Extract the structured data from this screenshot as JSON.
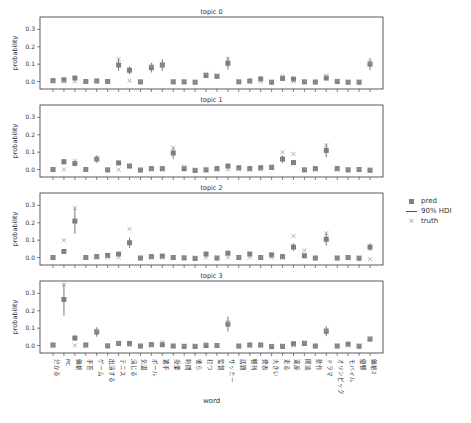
{
  "chart_data": [
    {
      "type": "scatter",
      "title": "topic 0",
      "xlabel": "word",
      "ylabel": "probability",
      "ylim": [
        -0.02,
        0.36
      ],
      "yticks": [
        "0.0",
        "0.1",
        "0.2",
        "0.3"
      ],
      "categories": [
        "分かる",
        "PC",
        "価格",
        "手首",
        "ゲーム",
        "出演する",
        "テニス",
        "演じる",
        "気温",
        "ボール",
        "選手",
        "授業",
        "時間",
        "彼ら",
        "打つ",
        "監督",
        "サッカー",
        "話題",
        "勝利",
        "発表",
        "大きい",
        "走る",
        "違反",
        "関連",
        "動作",
        "ドラマ",
        "オリンピック",
        "モバイル",
        "優勝",
        "価格2"
      ],
      "series": [
        {
          "name": "pred",
          "values": [
            0.005,
            0.01,
            0.02,
            0.0,
            0.003,
            0.0,
            0.095,
            0.065,
            -0.002,
            0.08,
            0.095,
            -0.002,
            -0.002,
            -0.004,
            0.035,
            0.03,
            0.105,
            -0.002,
            0.003,
            0.015,
            -0.004,
            0.018,
            0.014,
            -0.002,
            -0.003,
            0.02,
            0.0,
            -0.004,
            -0.004,
            0.1
          ]
        },
        {
          "name": "truth",
          "values": [
            0.0,
            0.0,
            0.0,
            0.0,
            0.0,
            0.0,
            0.13,
            0.005,
            0.0,
            0.09,
            0.1,
            0.0,
            0.0,
            0.0,
            0.045,
            0.035,
            0.13,
            0.0,
            0.0,
            0.0,
            0.0,
            0.03,
            0.0,
            0.0,
            0.0,
            0.035,
            0.005,
            0.0,
            0.0,
            0.11
          ]
        }
      ]
    },
    {
      "type": "scatter",
      "title": "topic 1",
      "ylabel": "probability",
      "ylim": [
        -0.02,
        0.36
      ],
      "series": [
        {
          "name": "pred",
          "values": [
            0.0,
            0.045,
            0.035,
            0.0,
            0.06,
            -0.002,
            0.038,
            0.02,
            -0.003,
            0.005,
            0.005,
            0.095,
            0.005,
            -0.005,
            -0.002,
            0.005,
            0.02,
            0.01,
            0.005,
            0.01,
            0.012,
            0.06,
            0.04,
            -0.002,
            0.005,
            0.11,
            0.005,
            -0.002,
            0.0,
            -0.004
          ]
        },
        {
          "name": "truth",
          "values": [
            0.0,
            0.0,
            0.05,
            0.0,
            0.06,
            0.0,
            0.0,
            0.025,
            0.0,
            0.0,
            0.0,
            0.125,
            0.015,
            0.0,
            0.0,
            0.0,
            0.0,
            0.0,
            0.0,
            0.0,
            0.02,
            0.1,
            0.09,
            0.0,
            0.0,
            0.14,
            0.0,
            0.0,
            0.0,
            0.0
          ]
        }
      ]
    },
    {
      "type": "scatter",
      "title": "topic 2",
      "ylabel": "probability",
      "ylim": [
        -0.02,
        0.36
      ],
      "series": [
        {
          "name": "pred",
          "values": [
            0.0,
            0.035,
            0.21,
            0.0,
            0.005,
            0.012,
            0.02,
            0.085,
            -0.003,
            0.005,
            0.008,
            0.0,
            -0.002,
            -0.005,
            0.02,
            -0.003,
            0.025,
            0.0,
            0.02,
            0.0,
            0.015,
            0.005,
            0.06,
            0.01,
            -0.003,
            0.105,
            -0.003,
            0.0,
            -0.004,
            0.06
          ]
        },
        {
          "name": "truth",
          "values": [
            0.0,
            0.1,
            0.285,
            0.0,
            0.0,
            0.0,
            0.0,
            0.165,
            0.0,
            0.0,
            0.0,
            0.0,
            0.0,
            0.0,
            0.0,
            0.0,
            0.0,
            0.0,
            0.0,
            0.0,
            0.0,
            0.0,
            0.125,
            0.04,
            0.0,
            0.14,
            0.0,
            0.0,
            0.0,
            -0.01
          ]
        }
      ]
    },
    {
      "type": "scatter",
      "title": "topic 3",
      "ylabel": "probability",
      "ylim": [
        -0.02,
        0.36
      ],
      "series": [
        {
          "name": "pred",
          "values": [
            0.003,
            0.265,
            0.043,
            0.003,
            0.078,
            -0.002,
            0.012,
            0.012,
            -0.003,
            0.005,
            0.005,
            -0.003,
            -0.005,
            -0.005,
            0.0,
            0.0,
            0.123,
            -0.003,
            0.003,
            0.003,
            -0.006,
            -0.005,
            0.01,
            0.012,
            -0.003,
            0.082,
            -0.003,
            0.008,
            -0.004,
            0.037
          ]
        },
        {
          "name": "truth",
          "values": [
            0.0,
            0.35,
            0.0,
            0.0,
            0.085,
            0.0,
            0.015,
            0.0,
            0.0,
            0.0,
            0.02,
            0.0,
            0.0,
            0.0,
            0.01,
            0.0,
            0.135,
            0.0,
            0.0,
            0.0,
            0.0,
            0.0,
            0.0,
            0.02,
            0.0,
            0.09,
            0.0,
            0.0,
            0.0,
            0.04
          ]
        }
      ]
    }
  ],
  "legend": [
    {
      "label": "pred",
      "marker": "square"
    },
    {
      "label": "90% HDI",
      "marker": "line"
    },
    {
      "label": "truth",
      "marker": "x"
    }
  ],
  "axis": {
    "xlabel": "word",
    "ylabel": "probability"
  },
  "colors": {
    "marker": "#7f7f7f",
    "line": "#555555",
    "truth": "#999999",
    "axes": "#333333"
  }
}
